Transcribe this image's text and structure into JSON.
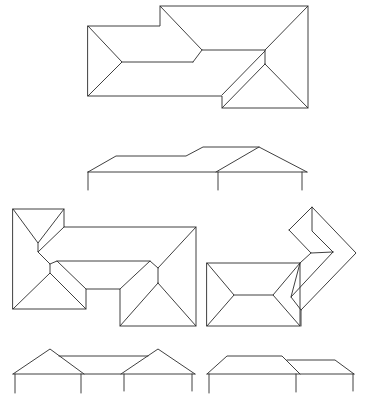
{
  "figure": {
    "stroke_color": "#2a2a2a",
    "background": "#ffffff",
    "panels": [
      {
        "id": "plan-1",
        "type": "roof-plan",
        "label": ""
      },
      {
        "id": "elevation-1",
        "type": "elevation",
        "label": ""
      },
      {
        "id": "plan-2",
        "type": "roof-plan",
        "label": ""
      },
      {
        "id": "plan-3",
        "type": "roof-plan",
        "label": ""
      },
      {
        "id": "elevation-2",
        "type": "elevation",
        "label": ""
      },
      {
        "id": "elevation-3",
        "type": "elevation",
        "label": ""
      }
    ]
  },
  "geometry": {
    "plan1": [
      "M88,26 L160,26 L160,6 L308,6 L308,108 L222,108 L222,96 L88,96 Z",
      "M88,26 L122,62 L88,96",
      "M122,62 L193,62",
      "M160,6 L202,50 L265,50",
      "M202,50 L193,62",
      "M308,6 L265,50 L265,64",
      "M265,64 L222,108",
      "M265,64 L308,108",
      "M265,51 L222,95"
    ],
    "elevation1": [
      "M88,172 L307,172",
      "M88,172 L116,156 L186,156 L203,147 L259,147 L307,172",
      "M216,172 L259,147",
      "M88,172 L88,190",
      "M218,172 L218,190",
      "M302,172 L302,190"
    ],
    "plan2": [
      "M13,209 L64,209 L64,227 L196,227 L196,326 L120,326 L120,289 L86,289 L86,309 L13,309 Z",
      "M13,209 L38,243 L64,209",
      "M38,243 L38,252 L64,227",
      "M38,252 L50,264 L50,273",
      "M13,309 L50,273 L86,309",
      "M50,264 L57,261 L86,289",
      "M57,261 L150,261 L158,268",
      "M196,227 L158,268 L158,283",
      "M158,283 L120,326",
      "M158,283 L196,326",
      "M150,261 L120,289"
    ],
    "plan3": [
      "M207,263 L300,263 L300,326 L207,326 Z",
      "M207,263 L234,295 L207,326",
      "M234,295 L273,295",
      "M300,263 L273,295 L300,326",
      "M300,263 L291,297",
      "M289,230 L312,207 L356,253 L301,310 L301,326",
      "M312,207 L312,231 L333,252",
      "M289,230 L311,253 L333,252",
      "M311,253 L300,263",
      "M333,252 L291,297 L301,310"
    ],
    "elevation2": [
      "M13,374 L195,374",
      "M13,374 L50,349 L84,374",
      "M59,356 L148,356",
      "M121,374 L158,349 L195,374",
      "M15,374 L15,393",
      "M81,374 L81,393",
      "M124,374 L124,391",
      "M192,374 L192,391"
    ],
    "elevation3": [
      "M207,374 L354,374",
      "M207,374 L227,356 L282,356 L300,374",
      "M287,360 L335,360 L354,374",
      "M209,374 L209,393",
      "M296,374 L296,392",
      "M353,374 L353,391"
    ]
  }
}
